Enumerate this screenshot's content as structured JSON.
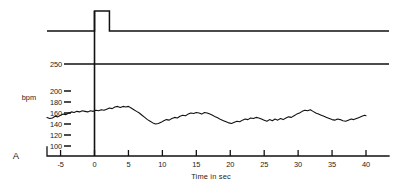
{
  "figure": {
    "panel_label": "A",
    "y_unit_label": "bpm",
    "x_axis_title": "Time in sec"
  },
  "chart_data": {
    "type": "line",
    "title": "",
    "subtitle": "",
    "xlabel": "Time in sec",
    "ylabel": "bpm",
    "xlim": [
      -7,
      40
    ],
    "ylim": [
      100,
      250
    ],
    "grid": false,
    "legend_position": "none",
    "x_ticks": [
      -5,
      0,
      5,
      10,
      15,
      20,
      25,
      30,
      35,
      40
    ],
    "x_tick_labels": [
      "-5",
      "0",
      "5",
      "10",
      "15",
      "20",
      "25",
      "30",
      "35",
      "40"
    ],
    "y_ticks": [
      100,
      120,
      140,
      160,
      180,
      200,
      250
    ],
    "y_tick_labels": [
      "100",
      "120",
      "140",
      "160",
      "180",
      "200",
      "250"
    ],
    "annotations": [
      {
        "name": "stimulus-marker",
        "type": "vertical-line",
        "x": 0,
        "label": ""
      },
      {
        "name": "reference-line-250",
        "type": "horizontal-line",
        "y": 250,
        "label": ""
      },
      {
        "name": "event-channel-baseline",
        "type": "horizontal-line",
        "label": ""
      },
      {
        "name": "event-pulse",
        "type": "square-pulse",
        "x_start": 0,
        "x_end": 2.2,
        "label": ""
      }
    ],
    "series": [
      {
        "name": "heart-rate",
        "units": "bpm",
        "x": [
          -7.0,
          -6.6,
          -6.2,
          -5.8,
          -5.4,
          -5.0,
          -4.6,
          -4.2,
          -3.8,
          -3.4,
          -3.0,
          -2.6,
          -2.2,
          -1.8,
          -1.4,
          -1.0,
          -0.6,
          -0.2,
          0.2,
          0.6,
          1.0,
          1.4,
          1.8,
          2.2,
          2.6,
          3.0,
          3.4,
          3.8,
          4.2,
          4.6,
          5.0,
          5.4,
          5.8,
          6.2,
          6.6,
          7.0,
          7.4,
          7.8,
          8.2,
          8.6,
          9.0,
          9.4,
          9.8,
          10.2,
          10.6,
          11.0,
          11.4,
          11.8,
          12.2,
          12.6,
          13.0,
          13.4,
          13.8,
          14.2,
          14.6,
          15.0,
          15.4,
          15.8,
          16.2,
          16.6,
          17.0,
          17.4,
          17.8,
          18.2,
          18.6,
          19.0,
          19.4,
          19.8,
          20.2,
          20.6,
          21.0,
          21.4,
          21.8,
          22.2,
          22.6,
          23.0,
          23.4,
          23.8,
          24.2,
          24.6,
          25.0,
          25.4,
          25.8,
          26.2,
          26.6,
          27.0,
          27.4,
          27.8,
          28.2,
          28.6,
          29.0,
          29.4,
          29.8,
          30.2,
          30.6,
          31.0,
          31.4,
          31.8,
          32.2,
          32.6,
          33.0,
          33.4,
          33.8,
          34.2,
          34.6,
          35.0,
          35.4,
          35.8,
          36.2,
          36.6,
          37.0,
          37.4,
          37.8,
          38.2,
          38.6,
          39.0,
          39.4,
          39.8,
          40.0
        ],
        "y": [
          152,
          150,
          151,
          154,
          153,
          156,
          158,
          157,
          160,
          162,
          161,
          163,
          162,
          164,
          163,
          162,
          164,
          163,
          165,
          164,
          166,
          165,
          167,
          169,
          168,
          171,
          172,
          170,
          172,
          171,
          172,
          169,
          166,
          163,
          160,
          156,
          152,
          148,
          145,
          142,
          140,
          141,
          143,
          146,
          148,
          147,
          150,
          152,
          151,
          154,
          156,
          155,
          158,
          160,
          159,
          161,
          160,
          158,
          161,
          160,
          158,
          156,
          153,
          151,
          148,
          146,
          144,
          142,
          141,
          143,
          145,
          144,
          147,
          149,
          148,
          151,
          150,
          152,
          151,
          149,
          147,
          145,
          148,
          146,
          149,
          147,
          150,
          148,
          151,
          153,
          152,
          155,
          158,
          160,
          163,
          165,
          164,
          166,
          163,
          160,
          158,
          156,
          154,
          152,
          150,
          148,
          147,
          149,
          148,
          146,
          145,
          147,
          149,
          148,
          150,
          152,
          154,
          156,
          155
        ]
      }
    ]
  }
}
